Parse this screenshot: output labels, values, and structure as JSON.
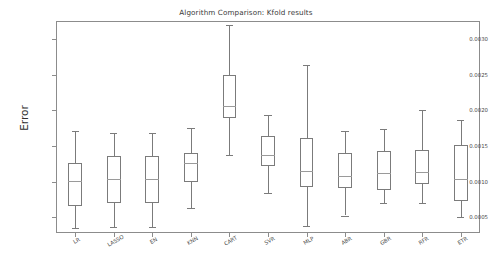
{
  "chart_data": {
    "type": "box",
    "title": "Algorithm Comparison: Kfold results",
    "xlabel": "",
    "ylabel": "Error",
    "grid": false,
    "legend": null,
    "ylim": [
      0.00028,
      0.00325
    ],
    "ytick_labels": [
      "0.0005",
      "0.0010",
      "0.0015",
      "0.0020",
      "0.0025",
      "0.0030"
    ],
    "ytick_values": [
      0.0005,
      0.001,
      0.0015,
      0.002,
      0.0025,
      0.003
    ],
    "categories": [
      "LR",
      "LASSO",
      "EN",
      "KNN",
      "CART",
      "SVR",
      "MLP",
      "ABR",
      "GBR",
      "RFR",
      "ETR"
    ],
    "boxes": [
      {
        "label": "LR",
        "whisker_low": 0.000355,
        "q1": 0.000665,
        "median": 0.001005,
        "q3": 0.001255,
        "whisker_high": 0.001715
      },
      {
        "label": "LASSO",
        "whisker_low": 0.000365,
        "q1": 0.0007,
        "median": 0.00104,
        "q3": 0.00136,
        "whisker_high": 0.001685
      },
      {
        "label": "EN",
        "whisker_low": 0.00036,
        "q1": 0.0007,
        "median": 0.00104,
        "q3": 0.001355,
        "whisker_high": 0.001675
      },
      {
        "label": "KNN",
        "whisker_low": 0.000635,
        "q1": 0.00099,
        "median": 0.001255,
        "q3": 0.001405,
        "whisker_high": 0.001755
      },
      {
        "label": "CART",
        "whisker_low": 0.00137,
        "q1": 0.00189,
        "median": 0.00206,
        "q3": 0.00249,
        "whisker_high": 0.003195
      },
      {
        "label": "SVR",
        "whisker_low": 0.000845,
        "q1": 0.001215,
        "median": 0.00137,
        "q3": 0.00164,
        "whisker_high": 0.00193
      },
      {
        "label": "MLP",
        "whisker_low": 0.000385,
        "q1": 0.00092,
        "median": 0.001155,
        "q3": 0.001605,
        "whisker_high": 0.00264
      },
      {
        "label": "ABR",
        "whisker_low": 0.000525,
        "q1": 0.000905,
        "median": 0.00108,
        "q3": 0.0014,
        "whisker_high": 0.001715
      },
      {
        "label": "GBR",
        "whisker_low": 0.000695,
        "q1": 0.00088,
        "median": 0.001115,
        "q3": 0.001425,
        "whisker_high": 0.001735
      },
      {
        "label": "RFR",
        "whisker_low": 0.0007,
        "q1": 0.00096,
        "median": 0.00113,
        "q3": 0.001445,
        "whisker_high": 0.002
      },
      {
        "label": "ETR",
        "whisker_low": 0.00051,
        "q1": 0.000735,
        "median": 0.00104,
        "q3": 0.001515,
        "whisker_high": 0.00186
      }
    ],
    "colors": {
      "box_edge": "#7b7b7b",
      "median": "#9a9a9a",
      "frame": "#8c8c8c",
      "background": "#ffffff",
      "text": "#4a4a4a"
    }
  }
}
